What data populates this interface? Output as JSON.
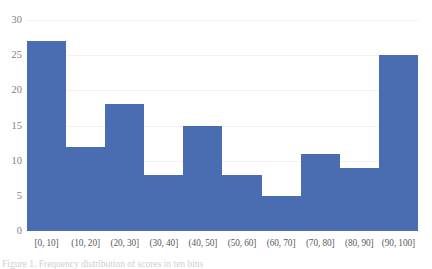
{
  "chart_data": {
    "type": "bar",
    "title": "",
    "subtitle": "",
    "xlabel": "",
    "ylabel": "",
    "categories": [
      "[0, 10]",
      "(10, 20]",
      "(20, 30]",
      "(30, 40]",
      "(40, 50]",
      "(50, 60]",
      "(60, 70]",
      "(70, 80]",
      "(80, 90]",
      "(90, 100]"
    ],
    "values": [
      27,
      12,
      18,
      8,
      15,
      8,
      5,
      11,
      9,
      25
    ],
    "series": [
      {
        "name": "frequency",
        "values": [
          27,
          12,
          18,
          8,
          15,
          8,
          5,
          11,
          9,
          25
        ]
      }
    ],
    "ylim": [
      0,
      30
    ],
    "y_ticks": [
      "0",
      "5",
      "10",
      "15",
      "20",
      "25",
      "30"
    ],
    "y_tick_values": [
      0,
      5,
      10,
      15,
      20,
      25,
      30
    ],
    "grid": "horizontal",
    "legend": "none",
    "bar_color": "#4a6cb0",
    "grid_color": "#f2f2f2",
    "axis_color": "#d9d9d9",
    "tick_label_color": "#7f7f7f",
    "category_label_color": "#595959",
    "plot_background": "#ffffff"
  },
  "caption": {
    "text": "Figure 1. Frequency distribution of scores in ten bins"
  }
}
